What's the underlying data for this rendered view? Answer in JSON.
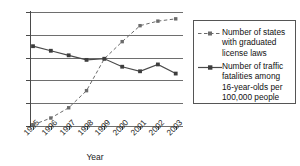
{
  "chart_data": {
    "type": "line",
    "title": "",
    "xlabel": "Year",
    "ylabel": "",
    "categories": [
      "1995",
      "1996",
      "1997",
      "1998",
      "1999",
      "2000",
      "2001",
      "2002",
      "2003"
    ],
    "x": [
      1995,
      1996,
      1997,
      1998,
      1999,
      2000,
      2001,
      2002,
      2003
    ],
    "ylim": [
      0,
      50
    ],
    "yticks": [
      0,
      10,
      20,
      30,
      40,
      50
    ],
    "ytick_labels": [
      "0",
      "10",
      "20",
      "30",
      "40",
      "50"
    ],
    "grid": true,
    "grid_axis": "y",
    "legend_position": "right",
    "series": [
      {
        "name": "Number of states with graduated license laws",
        "legend_label": "Number of states\nwith graduated\nlicense laws",
        "line_style": "dashed",
        "marker": "square",
        "color": "#6b6b6b",
        "values": [
          0.5,
          3.5,
          8,
          15.5,
          29.5,
          37,
          44,
          46,
          47
        ]
      },
      {
        "name": "Number of traffic fatalities among 16-year-olds per 100,000 people",
        "legend_label": "Number of traffic\nfatalities among\n16-year-olds per\n100,000 people",
        "line_style": "solid",
        "marker": "square",
        "color": "#4a4a4a",
        "values": [
          35,
          33,
          31,
          29,
          29.5,
          26,
          24,
          27,
          23
        ]
      }
    ]
  },
  "axes": {
    "x_title": "Year"
  },
  "colors": {
    "grid": "#6e6e6e",
    "axis": "#4a4a4a",
    "series_states": "#6b6b6b",
    "series_fatalities": "#4a4a4a",
    "legend_border": "#555555",
    "text": "#111111",
    "background": "#ffffff"
  }
}
